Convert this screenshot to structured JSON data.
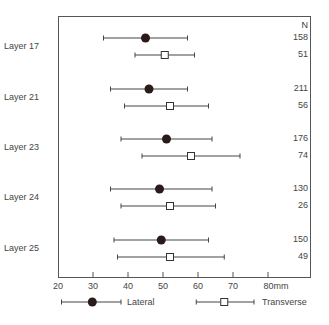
{
  "chart_data": {
    "type": "forest",
    "title": "",
    "xlabel": "mm",
    "ylabel": "",
    "xlim": [
      20,
      88
    ],
    "x_ticks": [
      20,
      30,
      40,
      50,
      60,
      70,
      80
    ],
    "x_tick_labels": [
      "20",
      "30",
      "40",
      "50",
      "60",
      "70",
      "80mm"
    ],
    "n_header": "N",
    "categories": [
      "Layer 17",
      "Layer 21",
      "Layer 23",
      "Layer 24",
      "Layer 25"
    ],
    "series": [
      {
        "name": "Lateral",
        "marker": "filled-circle",
        "mean": [
          45,
          46,
          51,
          49,
          49.5
        ],
        "low": [
          33,
          35,
          38,
          35,
          36
        ],
        "high": [
          57,
          57,
          64,
          64,
          63
        ],
        "n": [
          158,
          211,
          176,
          130,
          150
        ]
      },
      {
        "name": "Transverse",
        "marker": "open-square",
        "mean": [
          50.5,
          52,
          58,
          52,
          52
        ],
        "low": [
          42,
          39,
          44,
          38,
          37
        ],
        "high": [
          59,
          63,
          72,
          65,
          67.5
        ],
        "n": [
          51,
          56,
          74,
          26,
          49
        ]
      }
    ],
    "legend_position": "bottom",
    "grid": false
  },
  "legend": {
    "lateral": "Lateral",
    "transverse": "Transverse"
  }
}
